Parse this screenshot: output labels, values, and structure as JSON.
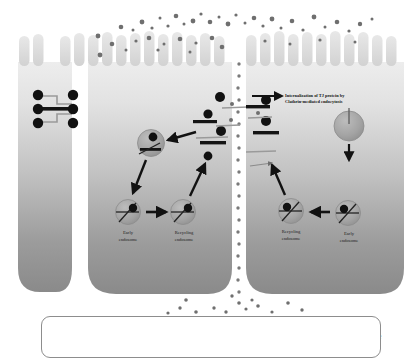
{
  "figure": {
    "annotation": {
      "line1": "Internalization of TJ protein by",
      "line2": "Clathrin-mediated endocytosis"
    }
  },
  "cells": {
    "left_cell": {
      "endosomes": [
        {
          "name": "early-endosome-left",
          "label_line1": "Early",
          "label_line2": "endosome",
          "cx": 128,
          "cy": 212,
          "r": 13
        },
        {
          "name": "recycling-endosome-left",
          "label_line1": "Recycling",
          "label_line2": "endosome",
          "cx": 183,
          "cy": 212,
          "r": 13
        },
        {
          "name": "apical-endosome-left",
          "label_line1": "",
          "label_line2": "",
          "cx": 151,
          "cy": 143,
          "r": 14
        }
      ]
    },
    "right_cell": {
      "endosomes": [
        {
          "name": "recycling-endosome-right",
          "label_line1": "Recycling",
          "label_line2": "endosome",
          "cx": 291,
          "cy": 211,
          "r": 13
        },
        {
          "name": "early-endosome-right",
          "label_line1": "Early",
          "label_line2": "endosome",
          "cx": 348,
          "cy": 213,
          "r": 13
        },
        {
          "name": "large-endosome-right",
          "label_line1": "",
          "label_line2": "",
          "cx": 349,
          "cy": 126,
          "r": 15
        }
      ]
    }
  },
  "legend": {
    "items": [
      {
        "key": "caco2",
        "label_line1": "Caco-2",
        "label_line2": "cell",
        "icon": "cell-swatch"
      },
      {
        "key": "zo1",
        "label": "ZO-1",
        "icon": "black-dot"
      },
      {
        "key": "claudin4",
        "label": "Claudin-4",
        "icon": "black-bar"
      },
      {
        "key": "occludin",
        "label": "Occludin,",
        "icon": "gray-line"
      },
      {
        "key": "tricellulin",
        "label": "Tricellulin",
        "icon": "gray-line"
      },
      {
        "key": "pla",
        "label": "PLA",
        "icon": "medium-gray-dot"
      },
      {
        "key": "fd4",
        "label": "FD-4",
        "icon": "small-gray-dot"
      },
      {
        "key": "endosome",
        "label": "Endosome",
        "icon": "gray-circle"
      }
    ]
  },
  "colors": {
    "cell_top": "#e4e4e4",
    "cell_bottom": "#8e8e8e",
    "zo1": "#111111",
    "claudin4": "#141414",
    "occludin": "#9a9a9a",
    "endosome_fill": "#a6a6a6",
    "pla_dot": "#6f6f6f",
    "fd4_dot": "#7d7d7d",
    "background": "#ffffff",
    "legend_border": "#8d8d8d"
  }
}
